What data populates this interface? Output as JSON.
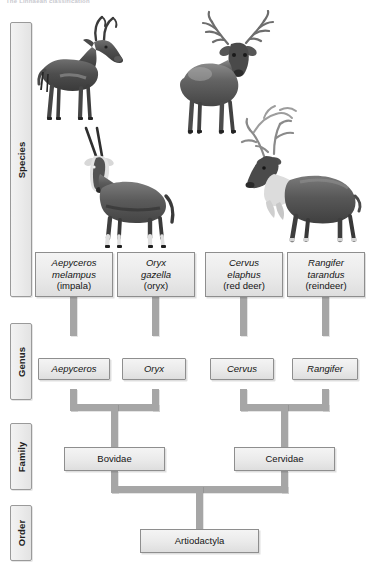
{
  "caption": "The Linnaean classification",
  "diagram": {
    "type": "taxonomic-tree",
    "colors": {
      "box_fill": "#eaeaea",
      "box_border": "#8e8e8e",
      "connector": "#a6a6a6",
      "text": "#141414"
    },
    "ranks": [
      {
        "id": "species",
        "label": "Species"
      },
      {
        "id": "genus",
        "label": "Genus"
      },
      {
        "id": "family",
        "label": "Family"
      },
      {
        "id": "order",
        "label": "Order"
      }
    ],
    "species": [
      {
        "genus_name": "Aepyceros",
        "epithet": "melampus",
        "common": "(impala)",
        "animal": "impala"
      },
      {
        "genus_name": "Oryx",
        "epithet": "gazella",
        "common": "(oryx)",
        "animal": "oryx"
      },
      {
        "genus_name": "Cervus",
        "epithet": "elaphus",
        "common": "(red deer)",
        "animal": "red-deer"
      },
      {
        "genus_name": "Rangifer",
        "epithet": "tarandus",
        "common": "(reindeer)",
        "animal": "reindeer"
      }
    ],
    "genera": [
      {
        "name": "Aepyceros"
      },
      {
        "name": "Oryx"
      },
      {
        "name": "Cervus"
      },
      {
        "name": "Rangifer"
      }
    ],
    "families": [
      {
        "name": "Bovidae"
      },
      {
        "name": "Cervidae"
      }
    ],
    "order": {
      "name": "Artiodactyla"
    },
    "animal_images": [
      {
        "id": "impala",
        "alt": "impala-photograph"
      },
      {
        "id": "red-deer",
        "alt": "red-deer-stag-photograph"
      },
      {
        "id": "oryx",
        "alt": "gemsbok-oryx-photograph"
      },
      {
        "id": "reindeer",
        "alt": "reindeer-photograph"
      }
    ]
  }
}
